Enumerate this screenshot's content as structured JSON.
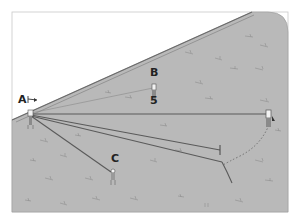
{
  "diagram": {
    "labels": {
      "a": "A",
      "b": "B",
      "c": "C",
      "five": "5"
    },
    "colors": {
      "ground": "#b9b9b9",
      "sky": "#ffffff",
      "frame": "#9a9a9a",
      "line": "#5a5a5a",
      "text": "#222222"
    }
  }
}
